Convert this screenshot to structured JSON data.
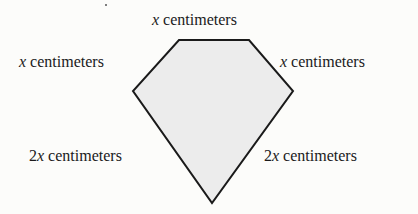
{
  "figure": {
    "shape": "pentagon",
    "fill_color": "#ececec",
    "stroke_color": "#1a1a1a",
    "side_labels": {
      "top": {
        "coef": "",
        "var": "x",
        "unit": "centimeters"
      },
      "upper_left": {
        "coef": "",
        "var": "x",
        "unit": "centimeters"
      },
      "upper_right": {
        "coef": "",
        "var": "x",
        "unit": "centimeters"
      },
      "lower_left": {
        "coef": "2",
        "var": "x",
        "unit": "centimeters"
      },
      "lower_right": {
        "coef": "2",
        "var": "x",
        "unit": "centimeters"
      }
    }
  }
}
